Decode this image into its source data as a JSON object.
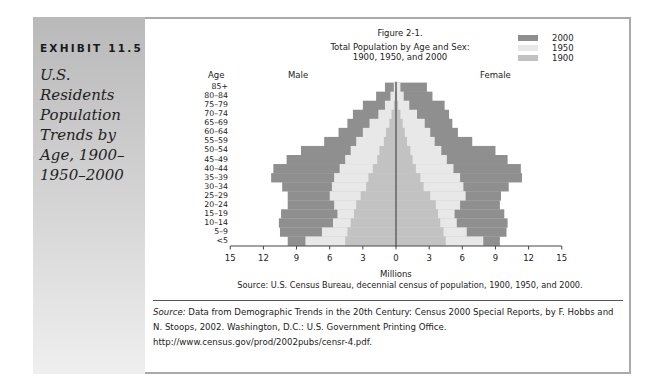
{
  "exhibit": {
    "label": "EXHIBIT 11.5",
    "title": "U.S. Residents Population Trends by Age, 1900–1950–2000"
  },
  "figure": {
    "number": "Figure 2-1.",
    "title_line1": "Total Population by Age and Sex:",
    "title_line2": "1900, 1950, and 2000",
    "age_header": "Age",
    "male_header": "Male",
    "female_header": "Female",
    "xlabel": "Millions",
    "source": "Source: U.S. Census Bureau, decennial census of population, 1900, 1950, and 2000."
  },
  "legend": [
    {
      "label": "2000",
      "color": "#8f8f8f"
    },
    {
      "label": "1950",
      "color": "#e8e8e8"
    },
    {
      "label": "1900",
      "color": "#c2c2c2"
    }
  ],
  "citation": {
    "lead": "Source:",
    "text": " Data from Demographic Trends in the 20th Century: Census 2000 Special Reports, by F. Hobbs and N. Stoops, 2002. Washington, D.C.: U.S. Government Printing Office. http://www.census.gov/prod/2002pubs/censr-4.pdf."
  },
  "chart_data": {
    "type": "bar",
    "subtype": "population-pyramid (horizontal, overlapping series)",
    "xlabel": "Millions",
    "ylabel": "Age",
    "xlim": [
      -15,
      15
    ],
    "x_ticks": [
      "15",
      "12",
      "9",
      "6",
      "3",
      "0",
      "3",
      "6",
      "9",
      "12",
      "15"
    ],
    "legend_position": "top-right",
    "grid": false,
    "categories": [
      "<5",
      "5–9",
      "10–14",
      "15–19",
      "20–24",
      "25–29",
      "30–34",
      "35–39",
      "40–44",
      "45–49",
      "50–54",
      "55–59",
      "60–64",
      "65–69",
      "70–74",
      "75–79",
      "80–84",
      "85+"
    ],
    "series": [
      {
        "name": "2000",
        "sex": "Male",
        "values": [
          9.8,
          10.5,
          10.6,
          10.4,
          9.8,
          9.8,
          10.3,
          11.3,
          11.1,
          9.9,
          8.6,
          6.5,
          5.2,
          4.4,
          3.9,
          3.0,
          1.8,
          1.0
        ]
      },
      {
        "name": "2000",
        "sex": "Female",
        "values": [
          9.4,
          10.0,
          10.1,
          9.8,
          9.4,
          9.5,
          10.2,
          11.4,
          11.3,
          10.1,
          9.0,
          6.9,
          5.6,
          5.1,
          4.8,
          4.4,
          3.3,
          2.8
        ]
      },
      {
        "name": "1950",
        "sex": "Male",
        "values": [
          8.2,
          6.7,
          5.7,
          5.3,
          5.6,
          6.0,
          5.8,
          5.6,
          5.1,
          4.6,
          4.1,
          3.6,
          3.0,
          2.4,
          1.6,
          1.0,
          0.5,
          0.2
        ]
      },
      {
        "name": "1950",
        "sex": "Female",
        "values": [
          7.9,
          6.4,
          5.5,
          5.3,
          5.8,
          6.3,
          6.1,
          5.8,
          5.2,
          4.6,
          4.1,
          3.5,
          3.1,
          2.6,
          1.9,
          1.2,
          0.7,
          0.4
        ]
      },
      {
        "name": "1900",
        "sex": "Male",
        "values": [
          4.6,
          4.4,
          4.1,
          3.8,
          3.6,
          3.2,
          2.7,
          2.5,
          2.1,
          1.7,
          1.5,
          1.1,
          0.9,
          0.6,
          0.4,
          0.2,
          0.1,
          0.05
        ]
      },
      {
        "name": "1900",
        "sex": "Female",
        "values": [
          4.5,
          4.3,
          4.0,
          3.8,
          3.6,
          3.1,
          2.5,
          2.2,
          1.8,
          1.5,
          1.3,
          1.0,
          0.8,
          0.6,
          0.4,
          0.2,
          0.1,
          0.05
        ]
      }
    ]
  }
}
